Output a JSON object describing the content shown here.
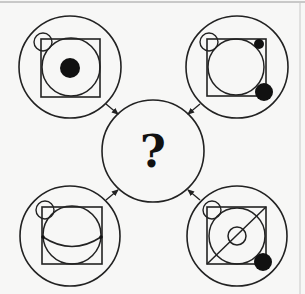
{
  "puzzle": {
    "center": {
      "label": "?",
      "x": 153,
      "y": 151,
      "r": 51
    },
    "colors": {
      "stroke": "#222222",
      "fill": "#111111",
      "background": "#f7f7f6",
      "border": "#9a9a9a"
    },
    "panels": [
      {
        "id": "top-left",
        "outer": {
          "cx": 70,
          "cy": 67,
          "r": 51
        },
        "square": {
          "x": 41,
          "y": 39,
          "w": 59,
          "h": 58
        },
        "inner_circle": {
          "cx": 71,
          "cy": 67,
          "r": 29
        },
        "small_open_circle": {
          "cx": 43,
          "cy": 42,
          "r": 9
        },
        "black_dots": [
          {
            "cx": 70,
            "cy": 68,
            "r": 10
          }
        ],
        "extra": "none",
        "arrow": {
          "x1": 106,
          "y1": 104,
          "x2": 118,
          "y2": 114
        }
      },
      {
        "id": "top-right",
        "outer": {
          "cx": 237,
          "cy": 67,
          "r": 51
        },
        "square": {
          "x": 207,
          "y": 39,
          "w": 59,
          "h": 57
        },
        "inner_circle": {
          "cx": 236,
          "cy": 67,
          "r": 28
        },
        "small_open_circle": {
          "cx": 209,
          "cy": 42,
          "r": 9
        },
        "black_dots": [
          {
            "cx": 259,
            "cy": 44,
            "r": 5
          },
          {
            "cx": 264,
            "cy": 92,
            "r": 9
          }
        ],
        "extra": "none",
        "arrow": {
          "x1": 200,
          "y1": 104,
          "x2": 188,
          "y2": 114
        }
      },
      {
        "id": "bottom-left",
        "outer": {
          "cx": 70,
          "cy": 236,
          "r": 50
        },
        "square": {
          "x": 42,
          "y": 207,
          "w": 60,
          "h": 57
        },
        "inner_circle": {
          "cx": 72,
          "cy": 235,
          "r": 29
        },
        "small_open_circle": {
          "cx": 45,
          "cy": 210,
          "r": 9
        },
        "black_dots": [],
        "extra": "equator-arc",
        "arrow": {
          "x1": 106,
          "y1": 200,
          "x2": 118,
          "y2": 190
        }
      },
      {
        "id": "bottom-right",
        "outer": {
          "cx": 237,
          "cy": 236,
          "r": 50
        },
        "square": {
          "x": 207,
          "y": 207,
          "w": 59,
          "h": 57
        },
        "inner_circle": {
          "cx": 237,
          "cy": 236,
          "r": 28
        },
        "small_open_circle": {
          "cx": 212,
          "cy": 210,
          "r": 9
        },
        "black_dots": [
          {
            "cx": 263,
            "cy": 262,
            "r": 9
          }
        ],
        "extra": "diagonal-with-center-circle",
        "arrow": {
          "x1": 200,
          "y1": 200,
          "x2": 188,
          "y2": 190
        }
      }
    ]
  }
}
